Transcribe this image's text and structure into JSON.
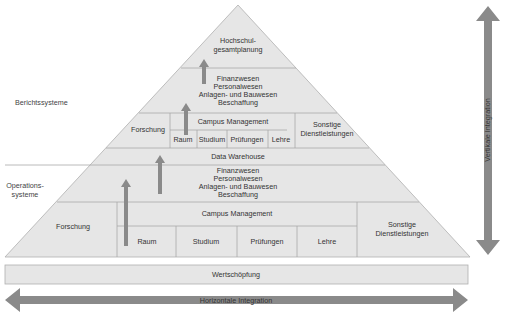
{
  "diagram": {
    "side_labels": {
      "reporting": "Berichtssysteme",
      "operations_line1": "Operations-",
      "operations_line2": "systeme"
    },
    "reporting_layers": {
      "top": [
        "Hochschul-",
        "gesamtplanung"
      ],
      "admin": [
        "Finanzwesen",
        "Personalwesen",
        "Anlagen- und Bauwesen",
        "Beschaffung"
      ],
      "research": "Forschung",
      "campus_management": "Campus Management",
      "campus_items": [
        "Raum",
        "Studium",
        "Prüfungen",
        "Lehre"
      ],
      "other": [
        "Sonstige",
        "Dienstleistungen"
      ]
    },
    "data_warehouse": "Data Warehouse",
    "operations_layers": {
      "admin": [
        "Finanzwesen",
        "Personalwesen",
        "Anlagen- und Bauwesen",
        "Beschaffung"
      ],
      "research": "Forschung",
      "campus_management": "Campus Management",
      "campus_items": [
        "Raum",
        "Studium",
        "Prüfungen",
        "Lehre"
      ],
      "other": [
        "Sonstige",
        "Dienstleistungen"
      ]
    },
    "value_creation": "Wertschöpfung",
    "horizontal_integration": "Horizontale Integration",
    "vertical_integration": "Vertikale Integration",
    "colors": {
      "pyramid_fill": "#e6e6e6",
      "line": "#a8a8a8",
      "arrow": "#8a8a8a",
      "text": "#333333"
    }
  }
}
